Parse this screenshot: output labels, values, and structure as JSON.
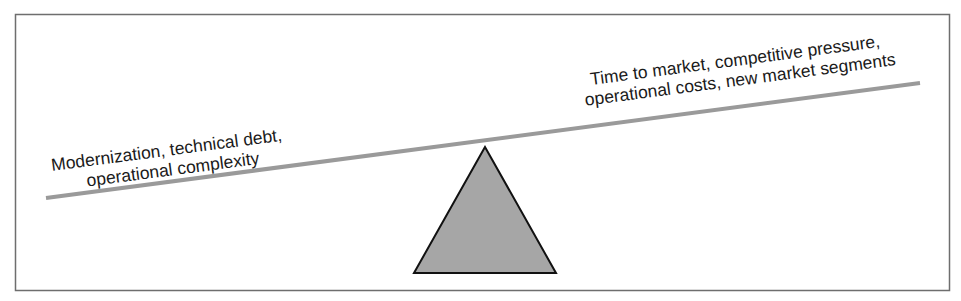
{
  "diagram": {
    "type": "balance-scale",
    "left_label": {
      "line1": "Modernization, technical debt,",
      "line2": "operational complexity"
    },
    "right_label": {
      "line1": "Time to market, competitive pressure,",
      "line2": "operational costs, new market segments"
    },
    "colors": {
      "border": "#6e6e6e",
      "beam": "#9a9a9a",
      "fulcrum_fill": "#a6a6a6",
      "fulcrum_stroke": "#111111",
      "text": "#1a1a1a"
    }
  }
}
